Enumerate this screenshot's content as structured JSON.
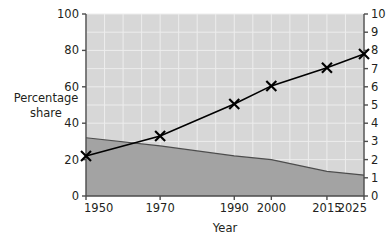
{
  "chart_data": {
    "type": "line",
    "title": "",
    "xlabel": "Year",
    "ylabel": "Percentage share",
    "ylabel_lines": [
      "Percentage",
      "share"
    ],
    "y2label": "",
    "grid": true,
    "legend": "none",
    "x": [
      1950,
      1970,
      1990,
      2000,
      2015,
      2025
    ],
    "categories": [
      "1950",
      "1970",
      "1990",
      "2000",
      "2015",
      "2025"
    ],
    "xlim": [
      1950,
      2025
    ],
    "ylim": [
      0,
      100
    ],
    "y2lim": [
      0,
      10
    ],
    "yticks": [
      0,
      20,
      40,
      60,
      80,
      100
    ],
    "ytick_labels": [
      "0",
      "20",
      "40",
      "60",
      "80",
      "100"
    ],
    "y2ticks": [
      0,
      1,
      2,
      3,
      4,
      5,
      6,
      7,
      8,
      9,
      10
    ],
    "y2tick_labels": [
      "0",
      "1",
      "2",
      "3",
      "4",
      "5",
      "6",
      "7",
      "8",
      "9",
      "10"
    ],
    "xticks": [
      1950,
      1970,
      1990,
      2000,
      2015,
      2025
    ],
    "xtick_labels": [
      "1950",
      "1970",
      "1990",
      "2000",
      "2015",
      "2025"
    ],
    "series": [
      {
        "name": "area-series",
        "type": "area",
        "axis": "left",
        "color": "#a3a3a3",
        "line_color": "#4d4d4d",
        "x": [
          1950,
          1970,
          1990,
          2000,
          2015,
          2025
        ],
        "values": [
          32,
          27.5,
          22,
          20,
          13.5,
          11.5
        ]
      },
      {
        "name": "line-series",
        "type": "line",
        "axis": "right",
        "color": "#000000",
        "marker": "x",
        "x": [
          1950,
          1970,
          1990,
          2000,
          2015,
          2025
        ],
        "values": [
          2.2,
          3.3,
          5.05,
          6.05,
          7.05,
          7.8
        ]
      }
    ],
    "colors": {
      "plot_background": "#d7d7d7",
      "gridline": "#ededed",
      "area_fill": "#a3a3a3",
      "area_line": "#555555",
      "line": "#000000",
      "axis": "#4d4d4d",
      "text": "#231f20"
    }
  }
}
